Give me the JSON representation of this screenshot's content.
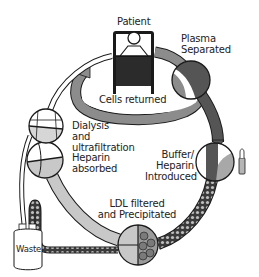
{
  "diagram": {
    "labels": {
      "patient": "Patient",
      "plasma_separated": "Plasma\nSeparated",
      "cells_returned": "Cells returned",
      "dialysis": "Dialysis\nand\nultrafiltration",
      "heparin_absorbed": "Heparin\nabsorbed",
      "buffer_heparin": "Buffer/\nHeparin\nIntroduced",
      "ldl_filtered": "LDL filtered\nand Precipitated",
      "waste": "Waste"
    },
    "colors": {
      "dark_tube": "#555555",
      "mid_tube": "#8c8c8c",
      "light_tube": "#c8c8c8",
      "outline": "#1a1a1a",
      "background": "#ffffff"
    },
    "nodes": [
      {
        "id": "patient",
        "label": "Patient"
      },
      {
        "id": "plasma-separator",
        "label": "Plasma Separated"
      },
      {
        "id": "buffer-heparin",
        "label": "Buffer/Heparin Introduced"
      },
      {
        "id": "ldl-filter",
        "label": "LDL filtered and Precipitated"
      },
      {
        "id": "heparin-adsorber",
        "label": "Heparin absorbed"
      },
      {
        "id": "dialyser",
        "label": "Dialysis and ultrafiltration"
      },
      {
        "id": "waste",
        "label": "Waste"
      }
    ],
    "flow": [
      "patient",
      "plasma-separator",
      "buffer-heparin",
      "ldl-filter",
      "heparin-adsorber",
      "dialyser",
      "patient"
    ]
  }
}
